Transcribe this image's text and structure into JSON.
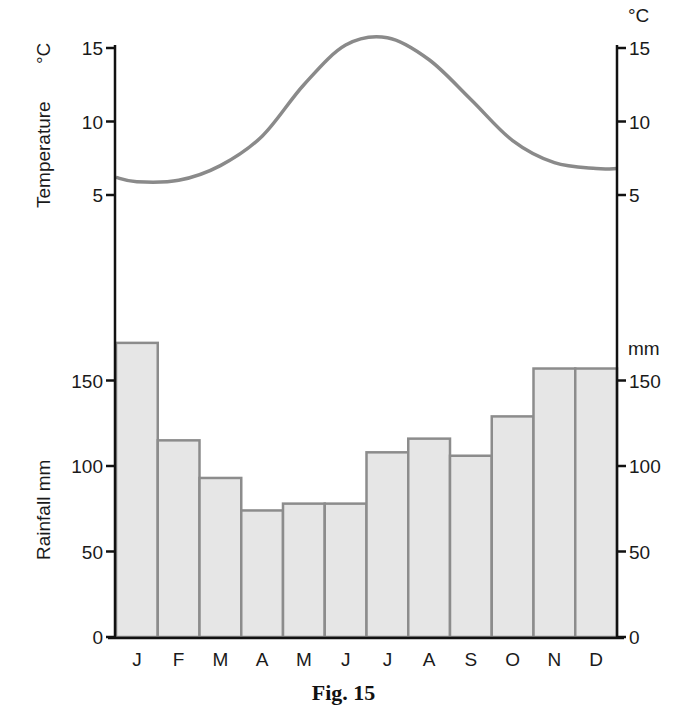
{
  "caption": "Fig. 15",
  "temperature_axis": {
    "title": "Temperature",
    "unit_left": "°C",
    "unit_right": "°C",
    "ticks": [
      5,
      10,
      15
    ]
  },
  "rainfall_axis": {
    "title": "Rainfall mm",
    "unit_right": "mm",
    "ticks": [
      0,
      50,
      100,
      150
    ]
  },
  "colors": {
    "bar_fill": "#e6e6e6",
    "bar_stroke": "#8c8c8c",
    "line": "#8a8a8a",
    "axis": "#111111"
  },
  "chart_data": {
    "type": "bar",
    "title": "Fig. 15",
    "categories": [
      "J",
      "F",
      "M",
      "A",
      "M",
      "J",
      "J",
      "A",
      "S",
      "O",
      "N",
      "D"
    ],
    "series": [
      {
        "name": "Rainfall mm",
        "type": "bar",
        "axis": "rainfall",
        "values": [
          172,
          115,
          93,
          74,
          78,
          78,
          108,
          116,
          106,
          129,
          157,
          157
        ]
      },
      {
        "name": "Temperature °C",
        "type": "line",
        "axis": "temperature",
        "values": [
          5.9,
          6.0,
          7.0,
          9.0,
          12.5,
          15.2,
          15.7,
          14.2,
          11.5,
          8.7,
          7.2,
          6.8
        ]
      }
    ],
    "xlabel": "",
    "ylabel_left_top": "Temperature °C",
    "ylabel_left_bottom": "Rainfall mm",
    "ylabel_right_top": "°C",
    "ylabel_right_bottom": "mm",
    "ylim_rainfall": [
      0,
      180
    ],
    "ylim_temperature": [
      5,
      16
    ],
    "grid": false,
    "legend": "none"
  }
}
